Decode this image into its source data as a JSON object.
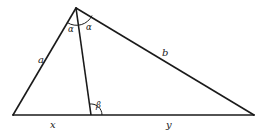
{
  "diagram": {
    "type": "triangle-angle-bisector",
    "stroke_color": "#1a1a1a",
    "background": "#ffffff",
    "vertices": {
      "apex": [
        76,
        8
      ],
      "bottom_left": [
        13,
        115
      ],
      "bottom_right": [
        254,
        115
      ],
      "bisector_foot": [
        91,
        115
      ]
    },
    "labels": {
      "side_left": "a",
      "side_right": "b",
      "base_left_segment": "x",
      "base_right_segment": "y",
      "apex_angle_left": "α",
      "apex_angle_right": "α",
      "foot_angle": "β"
    }
  }
}
